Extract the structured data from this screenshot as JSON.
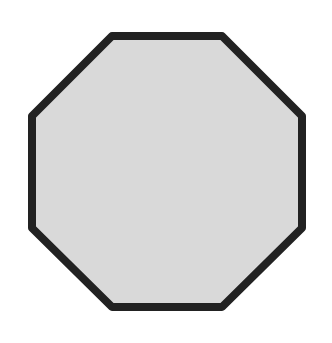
{
  "shape": {
    "type": "octagon",
    "fill_color": "#d9d9d9",
    "stroke_color": "#222222",
    "stroke_width": 8,
    "bounds": {
      "left": 28,
      "top": 32,
      "right": 306,
      "bottom": 311
    }
  }
}
